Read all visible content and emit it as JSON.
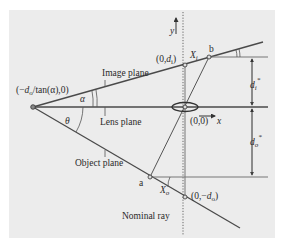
{
  "diagram": {
    "background_color": "#ececec",
    "line_color": "#4a4a4a",
    "labels": {
      "image_plane": "Image plane",
      "lens_plane": "Lens plane",
      "object_plane": "Object plane",
      "nominal_ray": "Nominal ray",
      "apex_point": "(−d₀/tan(α),0)",
      "apex_prefix": "(−",
      "apex_d": "d",
      "apex_sub": "o",
      "apex_suffix": "/tan(α),0)",
      "alpha": "α",
      "theta": "θ",
      "origin": "(0,0)",
      "image_point_prefix": "(0,",
      "image_point_d": "d",
      "image_point_sub": "i",
      "image_point_suffix": ")",
      "object_point_prefix": "(0,−",
      "object_point_d": "d",
      "object_point_sub": "o",
      "object_point_suffix": ")",
      "x_i": "X",
      "x_i_sub": "i",
      "x_o": "X",
      "x_o_sub": "o",
      "point_a": "a",
      "point_b": "b",
      "axis_x": "x",
      "axis_y": "y",
      "d_i_star": "d",
      "d_i_star_sub": "i",
      "d_o_star": "d",
      "d_o_star_sub": "o",
      "star": "*"
    }
  }
}
